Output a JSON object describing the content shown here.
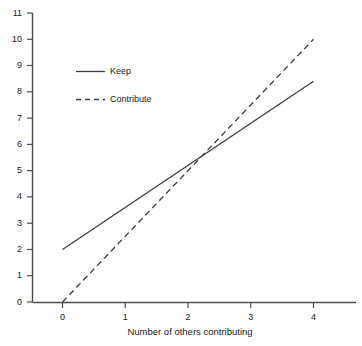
{
  "chart_data": {
    "type": "line",
    "title": "",
    "xlabel": "Number of others contributing",
    "ylabel": "",
    "xlim": [
      0,
      4.65
    ],
    "ylim": [
      0,
      11
    ],
    "xticks": [
      "0",
      "1",
      "2",
      "3",
      "4"
    ],
    "xtick_values": [
      0,
      1,
      2,
      3,
      4
    ],
    "yticks": [
      "0",
      "1",
      "2",
      "3",
      "4",
      "5",
      "6",
      "7",
      "8",
      "9",
      "10",
      "11"
    ],
    "ytick_values": [
      0,
      1,
      2,
      3,
      4,
      5,
      6,
      7,
      8,
      9,
      10,
      11
    ],
    "grid": false,
    "legend_position": "upper left",
    "series": [
      {
        "name": "Keep",
        "style": "solid",
        "color": "#3c3c3c",
        "x": [
          0,
          4
        ],
        "values": [
          2.0,
          8.4
        ]
      },
      {
        "name": "Contribute",
        "style": "dashed",
        "color": "#3c3c3c",
        "x": [
          0,
          4
        ],
        "values": [
          0.0,
          10.0
        ]
      }
    ],
    "intersection": {
      "x": 2.25,
      "y": 5.6
    }
  },
  "axes": {
    "x_axis_name": "x-axis",
    "y_axis_name": "y-axis"
  },
  "legend": {
    "items": [
      {
        "label": "Keep",
        "style": "solid"
      },
      {
        "label": "Contribute",
        "style": "dashed"
      }
    ]
  }
}
